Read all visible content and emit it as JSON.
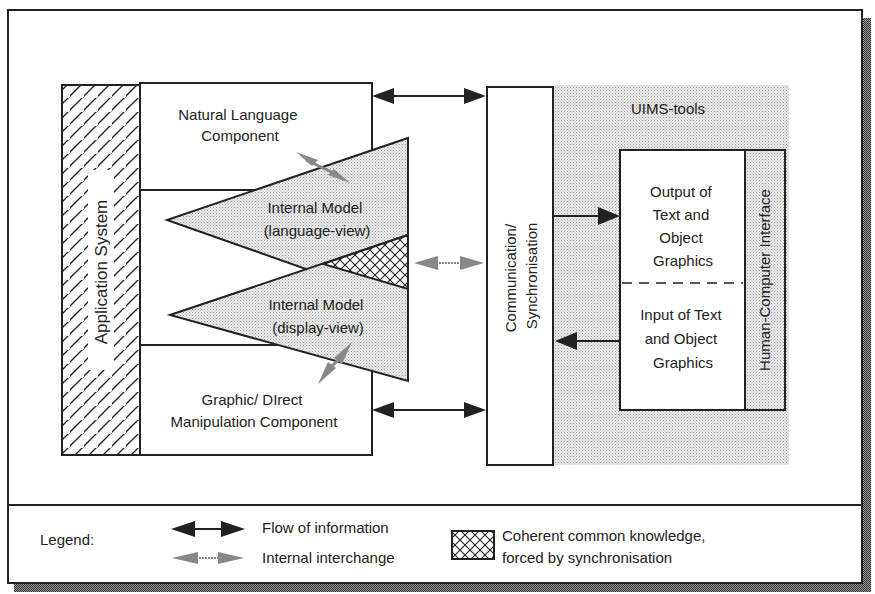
{
  "diagram": {
    "components": {
      "application_system": "Application System",
      "natural_language": [
        "Natural Language",
        "Component"
      ],
      "internal_model_language": [
        "Internal Model",
        "(language-view)"
      ],
      "internal_model_display": [
        "Internal Model",
        "(display-view)"
      ],
      "graphic_direct": [
        "Graphic/ DIrect",
        "Manipulation Component"
      ],
      "communication": [
        "Communication/",
        "Synchronisation"
      ],
      "uims_tools": "UIMS-tools",
      "output_box": [
        "Output of",
        "Text and",
        "Object",
        "Graphics"
      ],
      "input_box": [
        "Input of Text",
        "and Object",
        "Graphics"
      ],
      "hci": "Human-Computer Interface"
    },
    "legend": {
      "title": "Legend:",
      "flow": "Flow of information",
      "internal": "Internal interchange",
      "coherent": [
        "Coherent common knowledge,",
        "forced by synchronisation"
      ]
    },
    "colors": {
      "line": "#222222",
      "shade": "#d8d8d8",
      "dark_shade": "#777777",
      "background": "#ffffff"
    }
  }
}
